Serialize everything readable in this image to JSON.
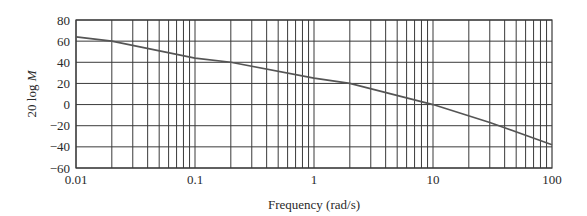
{
  "chart_data": {
    "type": "line",
    "title": "",
    "xlabel": "Frequency (rad/s)",
    "ylabel_prefix": "20 log ",
    "ylabel_var": "M",
    "ylabel": "20 log M",
    "x_scale": "log",
    "xlim": [
      0.01,
      100
    ],
    "ylim": [
      -60,
      80
    ],
    "x_ticks": [
      "0.01",
      "0.1",
      "1",
      "10",
      "100"
    ],
    "y_ticks": [
      "80",
      "60",
      "40",
      "20",
      "0",
      "−20",
      "−40",
      "−60"
    ],
    "grid": true,
    "legend": null,
    "series": [
      {
        "name": "Magnitude",
        "x": [
          0.01,
          0.02,
          0.1,
          0.2,
          1,
          2,
          10,
          30,
          100
        ],
        "y": [
          64,
          60,
          44,
          40,
          25,
          20,
          0,
          -17,
          -38
        ]
      }
    ],
    "colors": {
      "line": "#555555",
      "grid": "#3a3a3a"
    }
  }
}
